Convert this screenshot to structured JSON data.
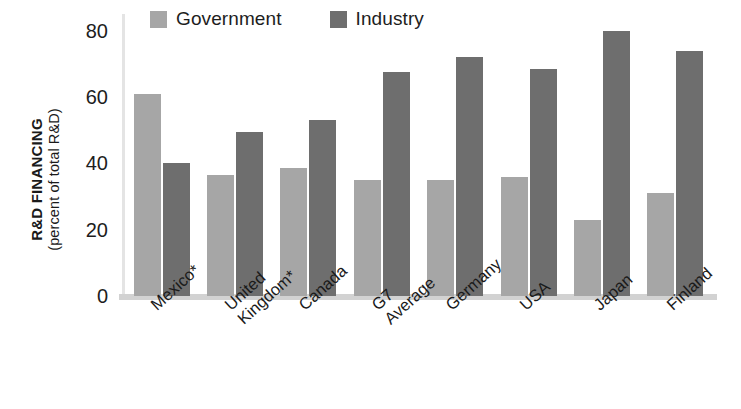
{
  "chart_data": {
    "type": "bar",
    "title": "",
    "xlabel": "",
    "ylabel": "R&D FINANCING (percent of total R&D)",
    "ylim": [
      0,
      85
    ],
    "yticks": [
      0,
      20,
      40,
      60,
      80
    ],
    "grid": false,
    "legend_position": "top",
    "categories": [
      "Mexico*",
      "United\nKingdom*",
      "Canada",
      "G7\nAverage",
      "Germany",
      "USA",
      "Japan",
      "Finland"
    ],
    "series": [
      {
        "name": "Government",
        "color": "#a6a6a6",
        "values": [
          61,
          36.5,
          38.5,
          35,
          35,
          36,
          23,
          31
        ]
      },
      {
        "name": "Industry",
        "color": "#6e6e6e",
        "values": [
          40,
          49.5,
          53,
          67.5,
          72,
          68.5,
          80,
          74
        ]
      }
    ],
    "footnote": ""
  },
  "axis": {
    "y_title_main": "R&D FINANCING",
    "y_title_sub": "(percent of total R&D)"
  },
  "colors": {
    "government": "#a6a6a6",
    "industry": "#6e6e6e",
    "axis": "#e4e4e4",
    "baseline": "#d2d2d2",
    "text": "#1a1a1a",
    "background": "#ffffff"
  }
}
